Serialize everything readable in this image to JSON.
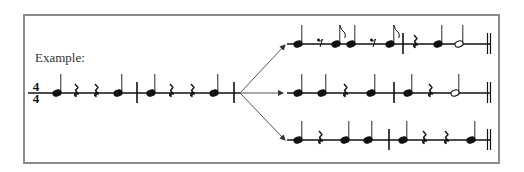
{
  "figure": {
    "label": "Example:",
    "time_signature": {
      "top": "4",
      "bottom": "4"
    },
    "colors": {
      "ink": "#111111",
      "frame": "#8a8a8a",
      "arrow": "#555555",
      "text": "#333333"
    }
  },
  "source_rhythm": {
    "staff_y": 93,
    "x_start": 28,
    "x_end": 240,
    "elements": [
      {
        "type": "quarter",
        "x": 57
      },
      {
        "type": "quarter-rest",
        "x": 76
      },
      {
        "type": "quarter-rest",
        "x": 96
      },
      {
        "type": "quarter",
        "x": 118
      },
      {
        "type": "barline",
        "x": 137
      },
      {
        "type": "quarter",
        "x": 151
      },
      {
        "type": "quarter-rest",
        "x": 171
      },
      {
        "type": "quarter-rest",
        "x": 192
      },
      {
        "type": "quarter",
        "x": 214
      },
      {
        "type": "barline",
        "x": 234
      }
    ]
  },
  "arrows": [
    {
      "from": [
        240,
        93
      ],
      "to": [
        285,
        45
      ]
    },
    {
      "from": [
        240,
        93
      ],
      "to": [
        283,
        93
      ]
    },
    {
      "from": [
        240,
        93
      ],
      "to": [
        285,
        140
      ]
    }
  ],
  "variations": [
    {
      "staff_y": 44,
      "x_start": 287,
      "x_end": 490,
      "elements": [
        {
          "type": "quarter",
          "x": 298
        },
        {
          "type": "eighth-rest",
          "x": 320
        },
        {
          "type": "eighth",
          "x": 336
        },
        {
          "type": "quarter",
          "x": 351
        },
        {
          "type": "eighth-rest",
          "x": 373
        },
        {
          "type": "eighth",
          "x": 390
        },
        {
          "type": "barline",
          "x": 403
        },
        {
          "type": "quarter-rest",
          "x": 415
        },
        {
          "type": "quarter",
          "x": 438
        },
        {
          "type": "half",
          "x": 459
        },
        {
          "type": "double-barline",
          "x": 489
        }
      ]
    },
    {
      "staff_y": 93,
      "x_start": 287,
      "x_end": 490,
      "elements": [
        {
          "type": "quarter",
          "x": 298
        },
        {
          "type": "quarter",
          "x": 322
        },
        {
          "type": "quarter-rest",
          "x": 345
        },
        {
          "type": "quarter",
          "x": 371
        },
        {
          "type": "barline",
          "x": 394
        },
        {
          "type": "quarter",
          "x": 408
        },
        {
          "type": "quarter-rest",
          "x": 430
        },
        {
          "type": "half",
          "x": 455
        },
        {
          "type": "double-barline",
          "x": 489
        }
      ]
    },
    {
      "staff_y": 140,
      "x_start": 287,
      "x_end": 490,
      "elements": [
        {
          "type": "quarter",
          "x": 298
        },
        {
          "type": "quarter-rest",
          "x": 320
        },
        {
          "type": "quarter",
          "x": 345
        },
        {
          "type": "quarter",
          "x": 368
        },
        {
          "type": "barline",
          "x": 389
        },
        {
          "type": "quarter",
          "x": 403
        },
        {
          "type": "quarter-rest",
          "x": 424
        },
        {
          "type": "quarter-rest",
          "x": 446
        },
        {
          "type": "quarter",
          "x": 471
        },
        {
          "type": "double-barline",
          "x": 489
        }
      ]
    }
  ]
}
